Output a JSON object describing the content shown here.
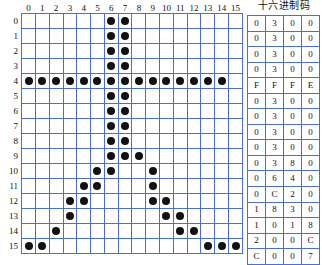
{
  "grid": {
    "name": "bitmap-font-grid",
    "width": 16,
    "height": 16,
    "col_headers": [
      "0",
      "1",
      "2",
      "3",
      "4",
      "5",
      "6",
      "7",
      "8",
      "9",
      "10",
      "11",
      "12",
      "13",
      "14",
      "15"
    ],
    "row_headers": [
      "0",
      "1",
      "2",
      "3",
      "4",
      "5",
      "6",
      "7",
      "8",
      "9",
      "10",
      "11",
      "12",
      "13",
      "14",
      "15"
    ],
    "grid_color": "#4a6fd0",
    "dot_color": "#111111",
    "rows": [
      [
        0,
        0,
        0,
        0,
        0,
        0,
        1,
        1,
        0,
        0,
        0,
        0,
        0,
        0,
        0,
        0
      ],
      [
        0,
        0,
        0,
        0,
        0,
        0,
        1,
        1,
        0,
        0,
        0,
        0,
        0,
        0,
        0,
        0
      ],
      [
        0,
        0,
        0,
        0,
        0,
        0,
        1,
        1,
        0,
        0,
        0,
        0,
        0,
        0,
        0,
        0
      ],
      [
        0,
        0,
        0,
        0,
        0,
        0,
        1,
        1,
        0,
        0,
        0,
        0,
        0,
        0,
        0,
        0
      ],
      [
        1,
        1,
        1,
        1,
        1,
        1,
        1,
        1,
        1,
        1,
        1,
        1,
        1,
        1,
        1,
        0
      ],
      [
        0,
        0,
        0,
        0,
        0,
        0,
        1,
        1,
        0,
        0,
        0,
        0,
        0,
        0,
        0,
        0
      ],
      [
        0,
        0,
        0,
        0,
        0,
        0,
        1,
        1,
        0,
        0,
        0,
        0,
        0,
        0,
        0,
        0
      ],
      [
        0,
        0,
        0,
        0,
        0,
        0,
        1,
        1,
        0,
        0,
        0,
        0,
        0,
        0,
        0,
        0
      ],
      [
        0,
        0,
        0,
        0,
        0,
        0,
        1,
        1,
        0,
        0,
        0,
        0,
        0,
        0,
        0,
        0
      ],
      [
        0,
        0,
        0,
        0,
        0,
        0,
        1,
        1,
        1,
        0,
        0,
        0,
        0,
        0,
        0,
        0
      ],
      [
        0,
        0,
        0,
        0,
        0,
        1,
        1,
        0,
        0,
        1,
        0,
        0,
        0,
        0,
        0,
        0
      ],
      [
        0,
        0,
        0,
        0,
        1,
        1,
        0,
        0,
        0,
        1,
        0,
        0,
        0,
        0,
        0,
        0
      ],
      [
        0,
        0,
        0,
        1,
        1,
        0,
        0,
        0,
        0,
        1,
        1,
        0,
        0,
        0,
        0,
        0
      ],
      [
        0,
        0,
        0,
        1,
        0,
        0,
        0,
        0,
        0,
        0,
        1,
        1,
        0,
        0,
        0,
        0
      ],
      [
        0,
        0,
        1,
        0,
        0,
        0,
        0,
        0,
        0,
        0,
        0,
        1,
        1,
        0,
        0,
        0
      ],
      [
        1,
        1,
        0,
        0,
        0,
        0,
        0,
        0,
        0,
        0,
        0,
        0,
        0,
        1,
        1,
        1
      ]
    ]
  },
  "hex_table": {
    "title": "十六进制码",
    "columns": 4,
    "rows": [
      [
        "0",
        "3",
        "0",
        "0"
      ],
      [
        "0",
        "3",
        "0",
        "0"
      ],
      [
        "0",
        "3",
        "0",
        "0"
      ],
      [
        "0",
        "3",
        "0",
        "0"
      ],
      [
        "F",
        "F",
        "F",
        "E"
      ],
      [
        "0",
        "3",
        "0",
        "0"
      ],
      [
        "0",
        "3",
        "0",
        "0"
      ],
      [
        "0",
        "3",
        "0",
        "0"
      ],
      [
        "0",
        "3",
        "0",
        "0"
      ],
      [
        "0",
        "3",
        "8",
        "0"
      ],
      [
        "0",
        "6",
        "4",
        "0"
      ],
      [
        "0",
        "C",
        "2",
        "0"
      ],
      [
        "1",
        "8",
        "3",
        "0"
      ],
      [
        "1",
        "0",
        "1",
        "8"
      ],
      [
        "2",
        "0",
        "0",
        "C"
      ],
      [
        "C",
        "0",
        "0",
        "7"
      ]
    ]
  }
}
